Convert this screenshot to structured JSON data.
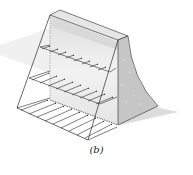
{
  "figure": {
    "caption": "(b)",
    "layers": 3,
    "colors": {
      "outline": "#2a2a2a",
      "dam_light": "#e8e8e8",
      "dam_mid": "#cfcfcf",
      "dam_dark": "#b4b4b4",
      "shadow": "#e2e2e2"
    }
  }
}
